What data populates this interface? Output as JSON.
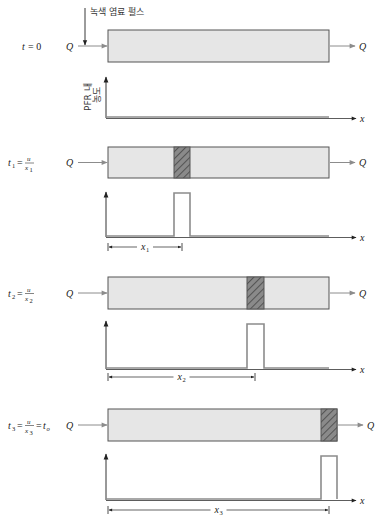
{
  "annotation": {
    "pulse_label": "녹색 염료 펄스"
  },
  "flow_label": "Q",
  "x_axis_label": "x",
  "y_axis_label_lines": [
    "PFR 내",
    "농도"
  ],
  "colors": {
    "reactor_fill": "#e6e6e6",
    "reactor_stroke": "#555555",
    "hatch_fill": "#8a8a8a",
    "hatch_line": "#444444",
    "signal_line": "#8c8c8c",
    "arrow_gray": "#8c8c8c",
    "axis": "#333333"
  },
  "panels": [
    {
      "id": "t0",
      "time_label": {
        "var": "t",
        "sub": "",
        "eq": "= 0",
        "fraction": null,
        "tail": ""
      },
      "reactor": {
        "x": 108,
        "y": 30,
        "w": 221,
        "h": 32
      },
      "hatch": null,
      "plot": {
        "axis_x": 106,
        "axis_top": 77,
        "baseline": 117,
        "end": 329
      },
      "pulse": null,
      "dimension": null,
      "show_y_label": true,
      "show_pulse_arrow": true
    },
    {
      "id": "t1",
      "time_label": {
        "var": "t",
        "sub": "1",
        "eq": "=",
        "fraction": {
          "num": "u",
          "den": "x",
          "den_sub": "1"
        },
        "tail": ""
      },
      "reactor": {
        "x": 108,
        "y": 147,
        "w": 221,
        "h": 31
      },
      "hatch": {
        "x": 174,
        "w": 16
      },
      "plot": {
        "axis_x": 106,
        "axis_top": 192,
        "baseline": 236,
        "end": 329
      },
      "pulse": {
        "x": 174,
        "w": 16,
        "top": 193
      },
      "dimension": {
        "label": "x",
        "sub": "1",
        "from": 108,
        "to": 182,
        "y": 247
      },
      "show_y_label": false,
      "show_pulse_arrow": false
    },
    {
      "id": "t2",
      "time_label": {
        "var": "t",
        "sub": "2",
        "eq": "=",
        "fraction": {
          "num": "u",
          "den": "x",
          "den_sub": "2"
        },
        "tail": ""
      },
      "reactor": {
        "x": 108,
        "y": 277,
        "w": 221,
        "h": 32
      },
      "hatch": {
        "x": 247,
        "w": 17
      },
      "plot": {
        "axis_x": 106,
        "axis_top": 321,
        "baseline": 368,
        "end": 329
      },
      "pulse": {
        "x": 247,
        "w": 17,
        "top": 324
      },
      "dimension": {
        "label": "x",
        "sub": "2",
        "from": 108,
        "to": 255,
        "y": 377
      },
      "show_y_label": false,
      "show_pulse_arrow": false
    },
    {
      "id": "t3",
      "time_label": {
        "var": "t",
        "sub": "3",
        "eq": "=",
        "fraction": {
          "num": "u",
          "den": "x",
          "den_sub": "3"
        },
        "tail": "= t",
        "tail_sub": "o"
      },
      "reactor": {
        "x": 108,
        "y": 409,
        "w": 229,
        "h": 32
      },
      "hatch": {
        "x": 321,
        "w": 16
      },
      "plot": {
        "axis_x": 106,
        "axis_top": 454,
        "baseline": 499,
        "end": 337
      },
      "pulse": {
        "x": 321,
        "w": 16,
        "top": 456
      },
      "dimension": {
        "label": "x",
        "sub": "3",
        "from": 108,
        "to": 329,
        "y": 510
      },
      "show_y_label": false,
      "show_pulse_arrow": false
    }
  ]
}
